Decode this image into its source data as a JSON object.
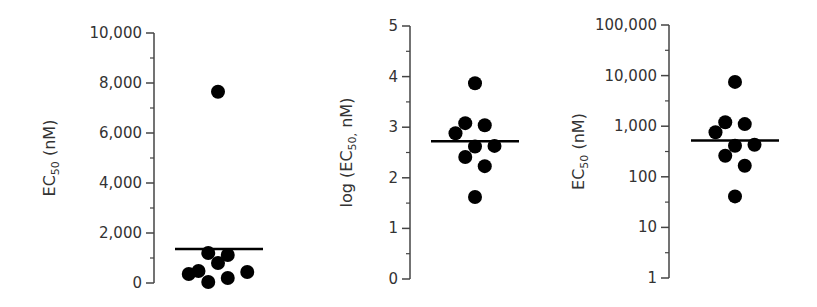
{
  "chart_data": [
    {
      "type": "scatter",
      "subtype": "dot-plot-with-median",
      "title": "",
      "ylabel": "EC50 (nM)",
      "ylabel_main": "EC",
      "ylabel_sub": "50",
      "ylabel_tail": " (nM)",
      "yscale": "linear",
      "ylim": [
        0,
        10000
      ],
      "yticks": [
        0,
        2000,
        4000,
        6000,
        8000,
        10000
      ],
      "ytick_labels": [
        "0",
        "2,000",
        "4,000",
        "6,000",
        "8,000",
        "10,000"
      ],
      "minor_ticks": [
        1000,
        3000,
        5000,
        7000,
        9000
      ],
      "points": [
        {
          "x": 0.0,
          "y": 7650
        },
        {
          "x": -0.5,
          "y": 1200
        },
        {
          "x": 0.5,
          "y": 1120
        },
        {
          "x": 0.0,
          "y": 800
        },
        {
          "x": -1.5,
          "y": 360
        },
        {
          "x": -1.0,
          "y": 480
        },
        {
          "x": -0.5,
          "y": 40
        },
        {
          "x": 0.5,
          "y": 200
        },
        {
          "x": 1.5,
          "y": 440
        }
      ],
      "median_line": 1360,
      "grid": false
    },
    {
      "type": "scatter",
      "subtype": "dot-plot-with-median",
      "title": "",
      "ylabel": "log (EC50, nM)",
      "ylabel_main": "log (EC",
      "ylabel_sub": "50,",
      "ylabel_tail": "  nM)",
      "yscale": "linear",
      "ylim": [
        0,
        5
      ],
      "yticks": [
        0,
        1,
        2,
        3,
        4,
        5
      ],
      "ytick_labels": [
        "0",
        "1",
        "2",
        "3",
        "4",
        "5"
      ],
      "minor_ticks": [
        0.5,
        1.5,
        2.5,
        3.5,
        4.5
      ],
      "points": [
        {
          "x": 0.0,
          "y": 3.87
        },
        {
          "x": -0.5,
          "y": 3.08
        },
        {
          "x": 0.5,
          "y": 3.04
        },
        {
          "x": -1.0,
          "y": 2.88
        },
        {
          "x": 0.0,
          "y": 2.62
        },
        {
          "x": 1.0,
          "y": 2.63
        },
        {
          "x": -0.5,
          "y": 2.41
        },
        {
          "x": 0.5,
          "y": 2.23
        },
        {
          "x": 0.0,
          "y": 1.62
        }
      ],
      "median_line": 2.72,
      "grid": false
    },
    {
      "type": "scatter",
      "subtype": "dot-plot-with-median",
      "title": "",
      "ylabel": "EC50 (nM)",
      "ylabel_main": "EC",
      "ylabel_sub": "50",
      "ylabel_tail": " (nM)",
      "yscale": "log",
      "ylim": [
        1,
        100000
      ],
      "yticks": [
        1,
        10,
        100,
        1000,
        10000,
        100000
      ],
      "ytick_labels": [
        "1",
        "10",
        "100",
        "1,000",
        "10,000",
        "100,000"
      ],
      "minor_ticks": [
        3.16,
        31.6,
        316,
        3162,
        31623
      ],
      "points": [
        {
          "x": 0.0,
          "y": 7500
        },
        {
          "x": -0.5,
          "y": 1200
        },
        {
          "x": 0.5,
          "y": 1100
        },
        {
          "x": -1.0,
          "y": 760
        },
        {
          "x": 0.0,
          "y": 410
        },
        {
          "x": 1.0,
          "y": 430
        },
        {
          "x": -0.5,
          "y": 260
        },
        {
          "x": 0.5,
          "y": 165
        },
        {
          "x": 0.0,
          "y": 41
        }
      ],
      "median_line": 520,
      "grid": false
    }
  ],
  "layout": {
    "panels": [
      {
        "axis_x": 154,
        "y_top": 33,
        "y_bottom": 283,
        "center_x": 218,
        "step_x": 19.5,
        "line_x1": 175,
        "line_x2": 263,
        "label_x": 55
      },
      {
        "axis_x": 410,
        "y_top": 26,
        "y_bottom": 279,
        "center_x": 475,
        "step_x": 19.5,
        "line_x1": 431,
        "line_x2": 519,
        "label_x": 352
      },
      {
        "axis_x": 669,
        "y_top": 25,
        "y_bottom": 278,
        "center_x": 735,
        "step_x": 19.5,
        "line_x1": 691,
        "line_x2": 779,
        "label_x": 584
      }
    ],
    "dot_radius": 7,
    "color": "#000000",
    "axis_color": "#444444"
  }
}
